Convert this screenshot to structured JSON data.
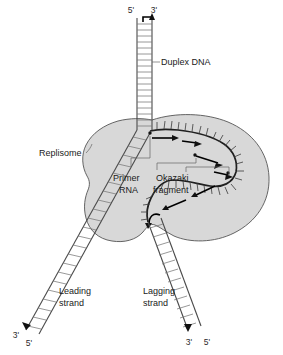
{
  "figure": {
    "background_color": "#ffffff",
    "replisome_fill": "#d8d8d8",
    "replisome_stroke": "#555555",
    "strand_color": "#1f1f1f",
    "ladder_color": "#777777"
  },
  "labels": {
    "duplex_dna": "Duplex DNA",
    "replisome": "Replisome",
    "primer_rna": "Primer\nRNA",
    "primer_rna_line1": "Primer",
    "primer_rna_line2": "RNA",
    "okazaki_line1": "Okazaki",
    "okazaki_line2": "fragment",
    "leading_line1": "Leading",
    "leading_line2": "strand",
    "lagging_line1": "Lagging",
    "lagging_line2": "strand"
  },
  "end_labels": {
    "top_left": "5'",
    "top_right": "3'",
    "leading_outer": "3'",
    "leading_inner": "5'",
    "lagging_inner": "3'",
    "lagging_outer": "5'"
  }
}
